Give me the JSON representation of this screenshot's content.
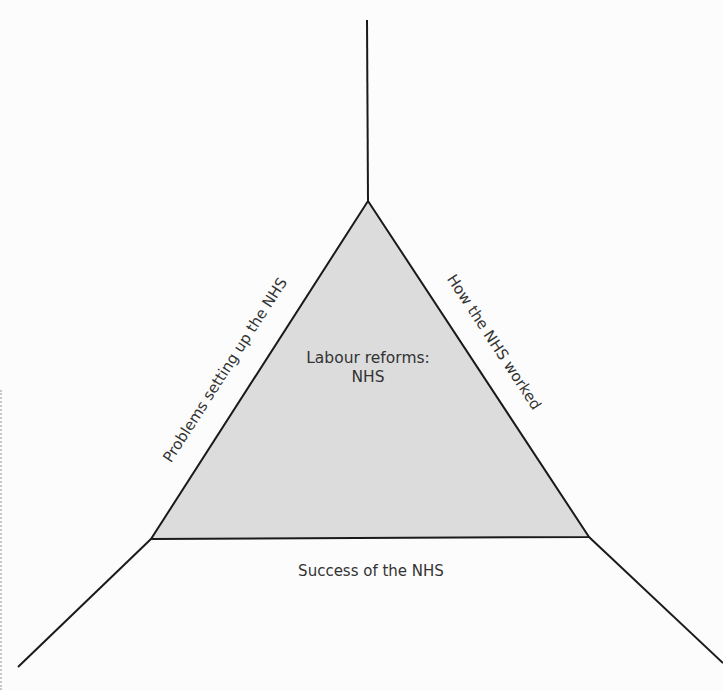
{
  "diagram": {
    "type": "triangle-framework",
    "center": {
      "line1": "Labour reforms:",
      "line2": "NHS"
    },
    "sides": {
      "left": "Problems setting up the NHS",
      "right": "How the NHS worked",
      "bottom": "Success of the NHS"
    },
    "colors": {
      "background": "#fcfcfc",
      "triangle_fill": "#dcdcdc",
      "stroke": "#1a1a1a",
      "text": "#333333"
    }
  }
}
